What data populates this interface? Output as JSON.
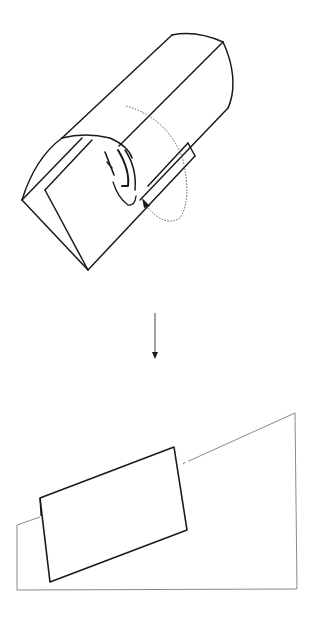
{
  "figure": {
    "colors": {
      "stroke": "#1a1a1a",
      "thin_stroke": "#8a8a8a",
      "background": "#ffffff"
    },
    "step_arrow": "down-arrow"
  }
}
